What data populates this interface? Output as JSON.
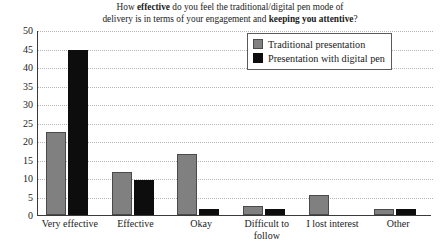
{
  "chart_data": {
    "type": "bar",
    "title": "How effective do you feel the traditional/digital pen mode of delivery is in terms of your engagement and keeping you attentive?",
    "title_line1_pre": "How ",
    "title_line1_bold": "effective",
    "title_line1_post": " do you feel the traditional/digital pen mode of",
    "title_line2_pre": "delivery is in terms of your engagement and ",
    "title_line2_bold": "keeping you attentive",
    "title_line2_post": "?",
    "xlabel": "",
    "ylabel": "",
    "ylim": [
      0,
      50
    ],
    "ytick_step": 5,
    "grid": true,
    "legend_position": "top-right",
    "categories": [
      "Very effective",
      "Effective",
      "Okay",
      "Difficult to follow",
      "I lost interest",
      "Other"
    ],
    "category_lines": [
      [
        "Very effective"
      ],
      [
        "Effective"
      ],
      [
        "Okay"
      ],
      [
        "Difficult to",
        "follow"
      ],
      [
        "I lost interest"
      ],
      [
        "Other"
      ]
    ],
    "yticks": [
      "0",
      "5",
      "10",
      "15",
      "20",
      "25",
      "30",
      "35",
      "40",
      "45",
      "50"
    ],
    "series": [
      {
        "name": "Traditional presentation",
        "color": "#808080",
        "values": [
          22,
          11,
          16,
          2,
          5,
          1
        ]
      },
      {
        "name": "Presentation with digital pen",
        "color": "#0d0d0d",
        "values": [
          44,
          9,
          1,
          1,
          0,
          1
        ]
      }
    ]
  },
  "legend": {
    "items": [
      {
        "label": "Traditional presentation"
      },
      {
        "label": "Presentation with digital pen"
      }
    ]
  }
}
